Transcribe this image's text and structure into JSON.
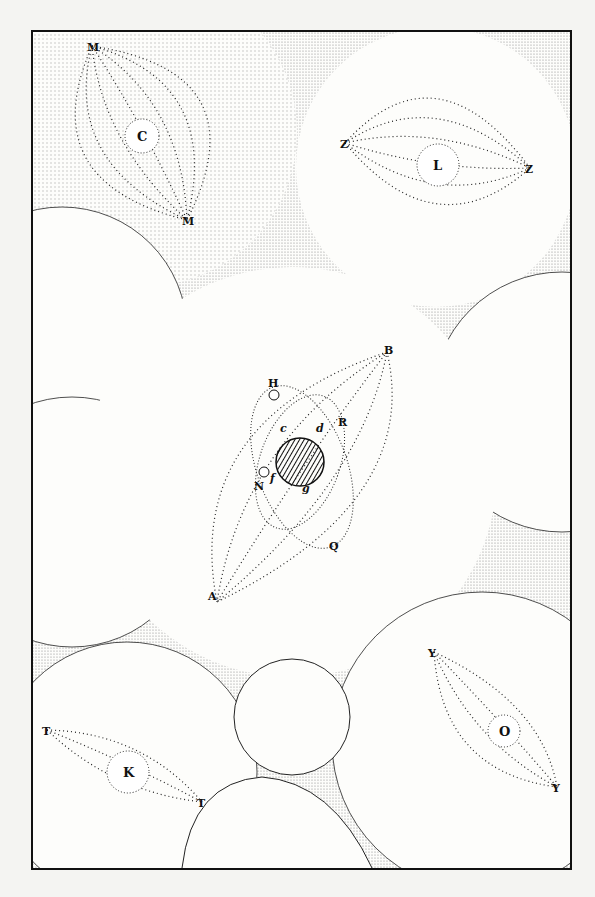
{
  "diagram": {
    "vortices": [
      {
        "id": "C",
        "label": "C",
        "cx": 140,
        "cy": 130,
        "r": 150,
        "poles": [
          "M",
          "M"
        ],
        "pole_positions": [
          [
            90,
            44
          ],
          [
            185,
            218
          ]
        ]
      },
      {
        "id": "L",
        "label": "L",
        "cx": 434,
        "cy": 165,
        "r": 140,
        "poles": [
          "Z",
          "Z"
        ],
        "pole_positions": [
          [
            343,
            141
          ],
          [
            528,
            166
          ]
        ]
      },
      {
        "id": "S",
        "label": "",
        "cx": 290,
        "cy": 470,
        "r": 215,
        "markers": [
          "B",
          "H",
          "R",
          "Q",
          "N",
          "A"
        ]
      },
      {
        "id": "O",
        "label": "O",
        "cx": 500,
        "cy": 730,
        "r": 190,
        "poles": [
          "Y",
          "Y"
        ],
        "pole_positions": [
          [
            432,
            650
          ],
          [
            555,
            785
          ]
        ]
      },
      {
        "id": "K",
        "label": "K",
        "cx": 125,
        "cy": 770,
        "r": 170,
        "poles": [
          "T",
          "T"
        ],
        "pole_positions": [
          [
            45,
            728
          ],
          [
            200,
            800
          ]
        ]
      }
    ],
    "central_body": {
      "cx": 298,
      "cy": 460,
      "r": 24,
      "hatched": true
    },
    "orbit_labels": {
      "H": "H",
      "R": "R",
      "N": "N",
      "Q": "Q",
      "B": "B",
      "A": "A",
      "c": "c",
      "d": "d",
      "f": "f",
      "g": "g"
    }
  }
}
